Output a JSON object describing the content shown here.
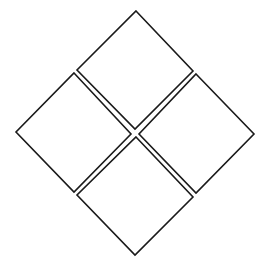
{
  "diagram": {
    "type": "diamond-grid",
    "background": "#ffffff",
    "stroke_color": "#1a1a1a",
    "fill_color": "#ffffff",
    "shapes": [
      {
        "name": "top-diamond",
        "points": "136,11 193,71 135,129 77,70"
      },
      {
        "name": "left-diamond",
        "points": "74,73 131,134 74,192 16,132"
      },
      {
        "name": "right-diamond",
        "points": "196,74 254,134 196,193 139,134"
      },
      {
        "name": "bottom-diamond",
        "points": "136,137 193,197 135,255 77,195"
      }
    ]
  }
}
